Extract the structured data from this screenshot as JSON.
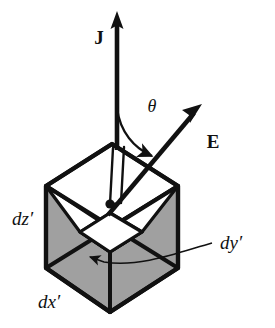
{
  "figure": {
    "background_color": "#ffffff",
    "ink_color": "#111111",
    "shaded_face_color": "#a0a0a0",
    "unshaded_face_color": "#ffffff",
    "width": 275,
    "height": 328
  },
  "labels": {
    "current_density": "J",
    "electric_field": "E",
    "angle": "θ",
    "dim_z": "dz′",
    "dim_x": "dx′",
    "dim_y": "dy′"
  },
  "vectors": [
    {
      "name": "current-density",
      "label": "J",
      "direction": "up-vertical",
      "tail": [
        140,
        205
      ],
      "head": [
        140,
        14
      ],
      "style": "solid-thick-filled-arrowhead"
    },
    {
      "name": "electric-field",
      "label": "E",
      "direction": "up-right-diagonal",
      "tail": [
        140,
        205
      ],
      "head": [
        205,
        106
      ],
      "style": "solid-thick-filled-arrowhead"
    }
  ],
  "angle_arc": {
    "name": "theta-arc",
    "from_vector": "current-density",
    "to_vector": "electric-field",
    "label": "θ",
    "label_position": [
      152,
      106
    ],
    "style": "thin-curved-arrow"
  },
  "cube": {
    "name": "volume-element",
    "projection": "oblique-isometric",
    "edge_style": "thick-black-outline",
    "faces": [
      {
        "name": "top-face",
        "shading": "white"
      },
      {
        "name": "left-face",
        "shading": "gray"
      },
      {
        "name": "right-face",
        "shading": "gray"
      },
      {
        "name": "inner-cut-face-left",
        "shading": "white"
      },
      {
        "name": "inner-cut-face-right",
        "shading": "white"
      },
      {
        "name": "inner-bottom-square",
        "shading": "white"
      }
    ],
    "center_marker": {
      "name": "center-point-dot",
      "position": [
        110,
        204
      ],
      "shape": "filled-circle"
    }
  },
  "leader_lines": [
    {
      "name": "dy-leader-line",
      "from": [
        209,
        246
      ],
      "to": [
        86,
        260
      ],
      "arrow_at": "to",
      "label": "dy′"
    }
  ],
  "label_positions": {
    "current_density": [
      99,
      39
    ],
    "electric_field": [
      208,
      144
    ],
    "angle": [
      152,
      106
    ],
    "dim_z": [
      14,
      222
    ],
    "dim_x": [
      40,
      305
    ],
    "dim_y": [
      221,
      253
    ]
  }
}
